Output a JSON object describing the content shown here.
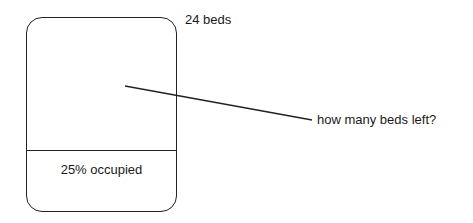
{
  "diagram": {
    "total_label": "24 beds",
    "occupied_label": "25% occupied",
    "question": "how many beds left?",
    "stroke_color": "#222222"
  }
}
